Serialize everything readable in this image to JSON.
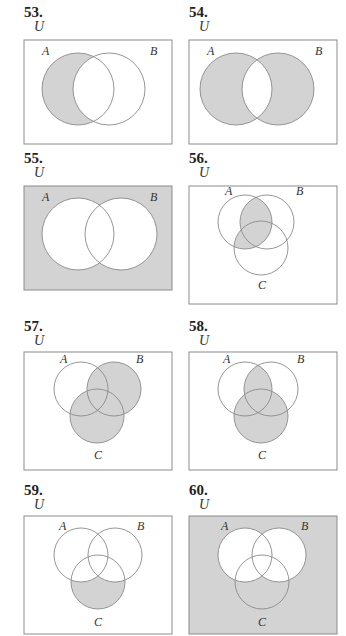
{
  "colors": {
    "shade": "#d3d3d3",
    "line": "#8a8a8a",
    "box": "#8c8c8c",
    "white": "#ffffff"
  },
  "exercises": [
    {
      "number": "53.",
      "sets": 2,
      "universe_label": "U",
      "labels": [
        "A",
        "B"
      ],
      "shaded": "A only (A minus B)"
    },
    {
      "number": "54.",
      "sets": 2,
      "universe_label": "U",
      "labels": [
        "A",
        "B"
      ],
      "shaded": "symmetric difference (A or B but not both)"
    },
    {
      "number": "55.",
      "sets": 2,
      "universe_label": "U",
      "labels": [
        "A",
        "B"
      ],
      "shaded": "outside A and B (complement of A union B)"
    },
    {
      "number": "56.",
      "sets": 3,
      "universe_label": "U",
      "labels": [
        "A",
        "B",
        "C"
      ],
      "shaded": "(A and B) or (A and C)"
    },
    {
      "number": "57.",
      "sets": 3,
      "universe_label": "U",
      "labels": [
        "A",
        "B",
        "C"
      ],
      "shaded": "B union C"
    },
    {
      "number": "58.",
      "sets": 3,
      "universe_label": "U",
      "labels": [
        "A",
        "B",
        "C"
      ],
      "shaded": "(A and B) union C"
    },
    {
      "number": "59.",
      "sets": 3,
      "universe_label": "U",
      "labels": [
        "A",
        "B",
        "C"
      ],
      "shaded": "C only (C minus (A union B))"
    },
    {
      "number": "60.",
      "sets": 3,
      "universe_label": "U",
      "labels": [
        "A",
        "B",
        "C"
      ],
      "shaded": "complement of (A union B)"
    }
  ]
}
